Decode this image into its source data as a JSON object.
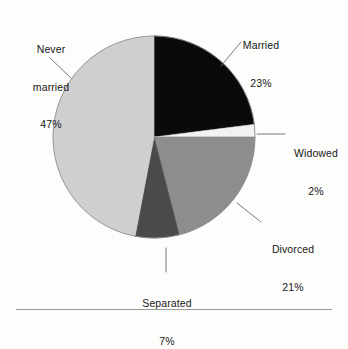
{
  "chart_data": {
    "type": "pie",
    "title": "",
    "subtitle": "",
    "xlabel": "",
    "ylabel": "",
    "legend_position": "none",
    "grid": false,
    "units": "percent",
    "start_angle_deg": 0,
    "direction": "clockwise",
    "categories": [
      "Married",
      "Widowed",
      "Divorced",
      "Separated",
      "Never married"
    ],
    "values": [
      23,
      2,
      21,
      7,
      47
    ],
    "slices": [
      {
        "label": "Married",
        "value": 23,
        "value_text": "23%",
        "color": "#0a0a0a",
        "label_lines": [
          "Married",
          "23%"
        ],
        "leader": "diagonal"
      },
      {
        "label": "Widowed",
        "value": 2,
        "value_text": "2%",
        "color": "#f2f2f2",
        "label_lines": [
          "Widowed",
          "2%"
        ],
        "leader": "horizontal"
      },
      {
        "label": "Divorced",
        "value": 21,
        "value_text": "21%",
        "color": "#8d8d8d",
        "label_lines": [
          "Divorced",
          "21%"
        ],
        "leader": "diagonal"
      },
      {
        "label": "Separated",
        "value": 7,
        "value_text": "7%",
        "color": "#4a4a4a",
        "label_lines": [
          "Separated",
          "7%"
        ],
        "leader": "vertical"
      },
      {
        "label": "Never married",
        "value": 47,
        "value_text": "47%",
        "color": "#cfcfcf",
        "label_lines": [
          "Never",
          "married",
          "47%"
        ],
        "leader": "diagonal"
      }
    ]
  },
  "labels": {
    "never_married": {
      "line1": "Never",
      "line2": "married",
      "pct": "47%"
    },
    "married": {
      "name": "Married",
      "pct": "23%"
    },
    "widowed": {
      "name": "Widowed",
      "pct": "2%"
    },
    "divorced": {
      "name": "Divorced",
      "pct": "21%"
    },
    "separated": {
      "name": "Separated",
      "pct": "7%"
    }
  },
  "colors": {
    "married": "#0a0a0a",
    "widowed": "#f2f2f2",
    "divorced": "#8d8d8d",
    "separated": "#4a4a4a",
    "never_married": "#cfcfcf",
    "outline": "#6f6f6f",
    "leader_line": "#6a6a6a",
    "rule": "#9a9a9a",
    "background": "#fdfdfc",
    "text": "#171717"
  }
}
